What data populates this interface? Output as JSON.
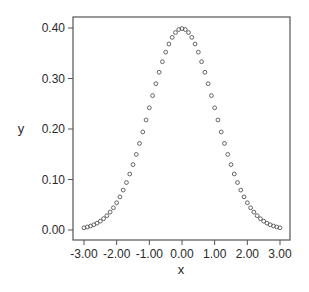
{
  "chart_data": {
    "type": "scatter",
    "title": "",
    "xlabel": "x",
    "ylabel": "y",
    "xlim": [
      -3.0,
      3.0
    ],
    "ylim": [
      0.0,
      0.4
    ],
    "grid": false,
    "legend": null,
    "marker": "open-circle",
    "x_ticks": [
      -3.0,
      -2.0,
      -1.0,
      0.0,
      1.0,
      2.0,
      3.0
    ],
    "x_tick_labels": [
      "-3.00",
      "-2.00",
      "-1.00",
      "0.00",
      "1.00",
      "2.00",
      "3.00"
    ],
    "y_ticks": [
      0.0,
      0.1,
      0.2,
      0.3,
      0.4
    ],
    "y_tick_labels": [
      "0.00",
      "0.10",
      "0.20",
      "0.30",
      "0.40"
    ],
    "x": [
      -3.0,
      -2.9,
      -2.8,
      -2.7,
      -2.6,
      -2.5,
      -2.4,
      -2.3,
      -2.2,
      -2.1,
      -2.0,
      -1.9,
      -1.8,
      -1.7,
      -1.6,
      -1.5,
      -1.4,
      -1.3,
      -1.2,
      -1.1,
      -1.0,
      -0.9,
      -0.8,
      -0.7,
      -0.6,
      -0.5,
      -0.4,
      -0.3,
      -0.2,
      -0.1,
      0.0,
      0.1,
      0.2,
      0.3,
      0.4,
      0.5,
      0.6,
      0.7,
      0.8,
      0.9,
      1.0,
      1.1,
      1.2,
      1.3,
      1.4,
      1.5,
      1.6,
      1.7,
      1.8,
      1.9,
      2.0,
      2.1,
      2.2,
      2.3,
      2.4,
      2.5,
      2.6,
      2.7,
      2.8,
      2.9,
      3.0
    ],
    "y": [
      0.0044,
      0.006,
      0.0079,
      0.0104,
      0.0136,
      0.0175,
      0.0224,
      0.0283,
      0.0355,
      0.044,
      0.054,
      0.0656,
      0.079,
      0.094,
      0.1109,
      0.1295,
      0.1497,
      0.1714,
      0.1942,
      0.2179,
      0.242,
      0.2661,
      0.2897,
      0.3123,
      0.3332,
      0.3521,
      0.3683,
      0.3814,
      0.391,
      0.397,
      0.3989,
      0.397,
      0.391,
      0.3814,
      0.3683,
      0.3521,
      0.3332,
      0.3123,
      0.2897,
      0.2661,
      0.242,
      0.2179,
      0.1942,
      0.1714,
      0.1497,
      0.1295,
      0.1109,
      0.094,
      0.079,
      0.0656,
      0.054,
      0.044,
      0.0355,
      0.0283,
      0.0224,
      0.0175,
      0.0136,
      0.0104,
      0.0079,
      0.006,
      0.0044
    ]
  },
  "colors": {
    "frame": "#555555",
    "marker": "#555555",
    "text": "#2a2a2a",
    "background": "#ffffff"
  }
}
